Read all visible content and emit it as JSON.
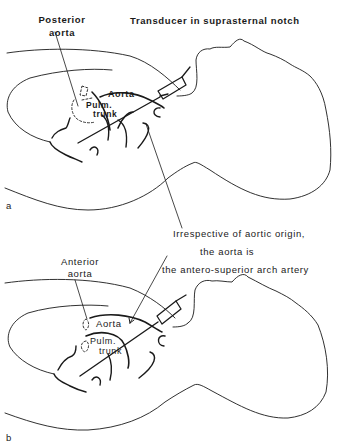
{
  "figure": {
    "panel_a": {
      "panel_label": "a",
      "title": "Transducer in suprasternal notch",
      "callout": "Posterior\naorta",
      "callout_line1": "Posterior",
      "callout_line2": "aorta",
      "vessel_aorta": "Aorta",
      "vessel_pulm_line1": "Pulm.",
      "vessel_pulm_line2": "trunk"
    },
    "caption": {
      "line1": "Irrespective of aortic origin,",
      "line2": "the aorta is",
      "line3": "the antero-superior arch artery"
    },
    "panel_b": {
      "panel_label": "b",
      "callout_line1": "Anterior",
      "callout_line2": "aorta",
      "vessel_aorta": "Aorta",
      "vessel_pulm_line1": "Pulm.",
      "vessel_pulm_line2": "trunk"
    }
  }
}
